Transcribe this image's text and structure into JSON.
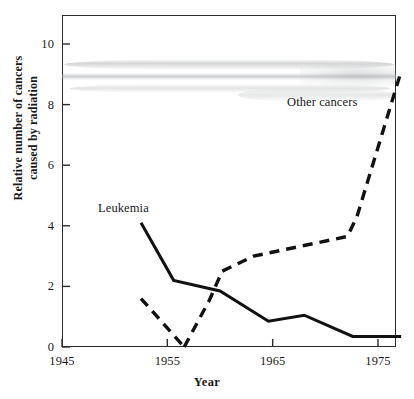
{
  "chart_data": {
    "type": "line",
    "title": "",
    "xlabel": "Year",
    "ylabel_line1": "Relative number of cancers",
    "ylabel_line2": "caused by radiation",
    "xlim": [
      1945,
      1978
    ],
    "ylim": [
      0,
      10.9
    ],
    "xticks": [
      1945,
      1955,
      1965,
      1975
    ],
    "xtick_labels": [
      "1945",
      "1955",
      "1965",
      "1975"
    ],
    "yticks": [
      0,
      2,
      4,
      6,
      8,
      10
    ],
    "ytick_labels": [
      "0",
      "2",
      "4",
      "6",
      "8",
      "10"
    ],
    "grid": false,
    "legend_position": "inline-annotation",
    "series": [
      {
        "name": "Leukemia",
        "style": "solid",
        "color": "#111111",
        "label_text": "Leukemia",
        "x": [
          1952.5,
          1955.6,
          1960.0,
          1964.6,
          1968.0,
          1972.6,
          1977.2
        ],
        "values": [
          4.1,
          2.2,
          1.85,
          0.85,
          1.05,
          0.35,
          0.35
        ]
      },
      {
        "name": "Other cancers",
        "style": "dashed",
        "color": "#111111",
        "label_text": "Other cancers",
        "segments": [
          {
            "x": [
              1952.5,
              1956.6
            ],
            "values": [
              1.6,
              0.0
            ]
          },
          {
            "x": [
              1956.6,
              1959.0,
              1960.2,
              1963.2,
              1972.1,
              1973.0,
              1977.2
            ],
            "values": [
              0.0,
              1.55,
              2.5,
              3.0,
              3.65,
              4.3,
              9.1
            ]
          }
        ]
      }
    ]
  },
  "annotations": {
    "leukemia_label": "Leukemia",
    "other_cancers_label": "Other cancers"
  },
  "artifacts": {
    "scan_smudge": "horizontal grey scan band across upper plot area"
  }
}
